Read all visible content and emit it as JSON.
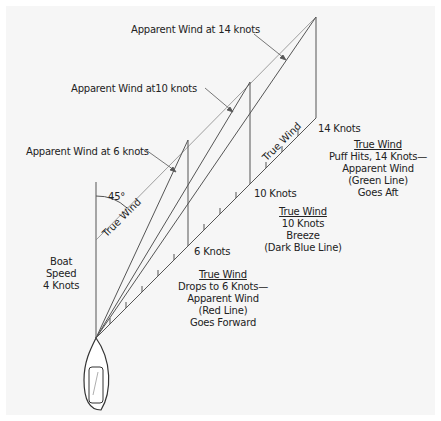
{
  "diagram": {
    "title_labels": {
      "apparent_14": "Apparent Wind at 14 knots",
      "apparent_10": "Apparent Wind at10 knots",
      "apparent_6": "Apparent Wind at 6 knots"
    },
    "angle_label": "45°",
    "true_wind_diag_label": "True Wind",
    "true_wind_axis_label": "True Wind",
    "boat_speed": [
      "Boat",
      "Speed",
      "4 Knots"
    ],
    "knots_labels": {
      "k6": "6 Knots",
      "k10": "10 Knots",
      "k14": "14 Knots"
    },
    "note_14": {
      "heading": "True Wind",
      "lines": [
        "Puff Hits, 14 Knots—",
        "Apparent Wind",
        "(Green Line)",
        "Goes Aft"
      ]
    },
    "note_10": {
      "heading": "True Wind",
      "lines": [
        "10 Knots",
        "Breeze",
        "(Dark Blue Line)"
      ]
    },
    "note_6": {
      "heading": "True Wind",
      "lines": [
        "Drops to 6 Knots—",
        "Apparent Wind",
        "(Red Line)",
        "Goes Forward"
      ]
    },
    "colors": {
      "background": "#f6f6f6",
      "line": "#555555",
      "thin_line": "#888888",
      "text": "#222222"
    }
  }
}
